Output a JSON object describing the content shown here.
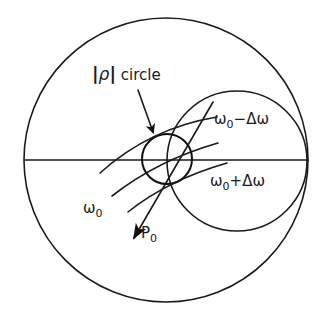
{
  "diagram": {
    "type": "smith-chart-sketch",
    "labels": {
      "rho_circle": {
        "bar_left": "|",
        "rho": "ρ",
        "bar_right": "|",
        "word": " circle"
      },
      "omega_minus": {
        "base": "ω",
        "sub": "0",
        "rest": "−Δω"
      },
      "omega_plus": {
        "base": "ω",
        "sub": "0",
        "rest": "+Δω"
      },
      "omega_0": {
        "base": "ω",
        "sub": "0"
      },
      "p0": {
        "base": "P",
        "sub": "0"
      }
    },
    "elements": {
      "outer_circle": {
        "cx": 166,
        "cy": 160,
        "r": 142
      },
      "horizontal_axis": {
        "x1": 25,
        "y1": 160,
        "x2": 308,
        "y2": 160
      },
      "resistance_circle": {
        "cx": 237,
        "cy": 162,
        "r": 70
      },
      "rho_circle": {
        "cx": 167,
        "cy": 159,
        "r": 25
      },
      "arcs": [
        {
          "name": "omega0-minus-delta",
          "from": [
            100,
            173
          ],
          "ctrl": [
            150,
            130
          ],
          "to": [
            217,
            117
          ]
        },
        {
          "name": "omega0",
          "from": [
            112,
            196
          ],
          "ctrl": [
            160,
            160
          ],
          "to": [
            218,
            143
          ]
        },
        {
          "name": "omega0-plus-delta",
          "from": [
            128,
            212
          ],
          "ctrl": [
            170,
            180
          ],
          "to": [
            227,
            163
          ]
        }
      ],
      "p0_line": {
        "from": [
          213,
          102
        ],
        "to": [
          133,
          240
        ]
      },
      "pointer_arrow": {
        "from": [
          138,
          90
        ],
        "to": [
          152,
          132
        ]
      }
    },
    "colors": {
      "ink": "#1a1a1a",
      "background": "#ffffff"
    }
  }
}
